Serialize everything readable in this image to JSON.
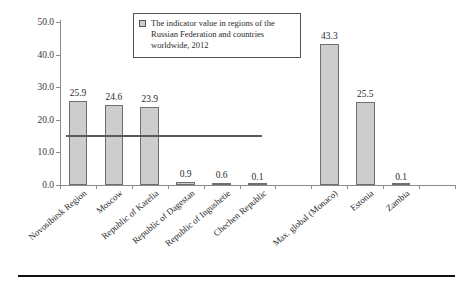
{
  "legend": {
    "text": "The indicator value in regions of the Russian Federation and countries worldwide, 2012",
    "swatch_color": "#cdcdcd"
  },
  "colors": {
    "bar_fill": "#cdcdcd",
    "bar_border": "#6f6f6f",
    "axis": "#8a8a8a",
    "reference_line": "#5a5a5a",
    "text": "#2b2b2b"
  },
  "chart_data": {
    "type": "bar",
    "title": "",
    "subtitle": "",
    "xlabel": "",
    "ylabel": "",
    "ylim": [
      0.0,
      50.0
    ],
    "yticks": [
      "0.0",
      "10.0",
      "20.0",
      "30.0",
      "40.0",
      "50.0"
    ],
    "ytick_values": [
      0.0,
      10.0,
      20.0,
      30.0,
      40.0,
      50.0
    ],
    "grid": false,
    "legend_position": "top-center",
    "legend_entries": [
      "The indicator value in regions of the Russian Federation and countries worldwide, 2012"
    ],
    "categories": [
      "Novosibirsk Region",
      "Moscow",
      "Republic of Karelia",
      "Republic of Dagestan",
      "Republic of Ingushetie",
      "Chechen Republic",
      "",
      "Max. global (Monaco)",
      "Estonia",
      "Zambia",
      ""
    ],
    "values": [
      25.9,
      24.6,
      23.9,
      0.9,
      0.6,
      0.1,
      null,
      43.3,
      25.5,
      0.1,
      null
    ],
    "data_labels": [
      "25.9",
      "24.6",
      "23.9",
      "0.9",
      "0.6",
      "0.1",
      "",
      "43.3",
      "25.5",
      "0.1",
      ""
    ],
    "annotations": [
      {
        "type": "reference-line",
        "orientation": "horizontal",
        "value": 15.3,
        "from_category_index": 0,
        "to_category_index": 5
      }
    ]
  }
}
